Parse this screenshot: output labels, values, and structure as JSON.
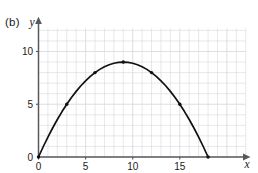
{
  "figure": {
    "part_label": "(b)",
    "background_color": "#ffffff",
    "grid_color": "#d8d8de",
    "axis_color": "#58585e",
    "curve_color": "#111111",
    "marker_color": "#111111"
  },
  "chart_data": {
    "type": "line",
    "title": "",
    "subtitle": "",
    "xlabel": "x",
    "ylabel": "y",
    "xlim": [
      0,
      22
    ],
    "ylim": [
      0,
      13.5
    ],
    "xticks": [
      0,
      5,
      10,
      15
    ],
    "xticklabels": [
      "0",
      "5",
      "10",
      "15"
    ],
    "yticks": [
      0,
      5,
      10
    ],
    "yticklabels": [
      "0",
      "5",
      "10"
    ],
    "grid": true,
    "grid_step_x": 1,
    "grid_step_y": 1,
    "legend": null,
    "legend_position": "none",
    "annotations": [],
    "series": [
      {
        "name": "parabola",
        "equation": "y = x(18 - x)/9",
        "markers": true,
        "x": [
          0,
          3,
          6,
          9,
          12,
          15,
          18
        ],
        "values": [
          0,
          5,
          8,
          9,
          8,
          5,
          0
        ],
        "curve_x": [
          0,
          0.5,
          1,
          1.5,
          2,
          2.5,
          3,
          3.5,
          4,
          4.5,
          5,
          5.5,
          6,
          6.5,
          7,
          7.5,
          8,
          8.5,
          9,
          9.5,
          10,
          10.5,
          11,
          11.5,
          12,
          12.5,
          13,
          13.5,
          14,
          14.5,
          15,
          15.5,
          16,
          16.5,
          17,
          17.5,
          18
        ],
        "curve_y": [
          0,
          0.972,
          1.889,
          2.75,
          3.556,
          4.306,
          5,
          5.639,
          6.222,
          6.75,
          7.222,
          7.639,
          8,
          8.306,
          8.556,
          8.75,
          8.889,
          8.972,
          9,
          8.972,
          8.889,
          8.75,
          8.556,
          8.306,
          8,
          7.639,
          7.222,
          6.75,
          6.222,
          5.639,
          5,
          4.306,
          3.556,
          2.75,
          1.889,
          0.972,
          0
        ]
      }
    ]
  }
}
